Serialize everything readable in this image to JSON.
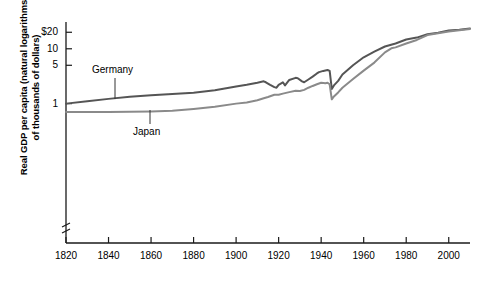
{
  "chart_data": {
    "type": "line",
    "title": "",
    "xlabel": "",
    "ylabel_line1": "Real GDP per capita (natural logarithms",
    "ylabel_line2": "of thousands of dollars)",
    "yscale": "log",
    "ytick_labels": [
      "$20",
      "10",
      "5",
      "1"
    ],
    "ytick_values": [
      20,
      10,
      5,
      1
    ],
    "xtick_labels": [
      "1820",
      "1840",
      "1860",
      "1880",
      "1900",
      "1920",
      "1940",
      "1960",
      "1980",
      "2000"
    ],
    "xtick_values": [
      1820,
      1840,
      1860,
      1880,
      1900,
      1920,
      1940,
      1960,
      1980,
      2000
    ],
    "xlim": [
      1820,
      2010
    ],
    "ylim": [
      0.55,
      26
    ],
    "grid": false,
    "legend": "inline-annotations",
    "axis_break": "y-axis break below 1",
    "series": [
      {
        "name": "Germany",
        "color": "#555555",
        "annotation": "Germany",
        "points": [
          [
            1820,
            1.0
          ],
          [
            1830,
            1.1
          ],
          [
            1840,
            1.22
          ],
          [
            1850,
            1.33
          ],
          [
            1860,
            1.42
          ],
          [
            1870,
            1.5
          ],
          [
            1880,
            1.58
          ],
          [
            1890,
            1.75
          ],
          [
            1900,
            2.05
          ],
          [
            1905,
            2.2
          ],
          [
            1910,
            2.4
          ],
          [
            1913,
            2.55
          ],
          [
            1914,
            2.45
          ],
          [
            1916,
            2.2
          ],
          [
            1918,
            2.0
          ],
          [
            1919,
            1.95
          ],
          [
            1920,
            2.2
          ],
          [
            1922,
            2.45
          ],
          [
            1923,
            2.15
          ],
          [
            1925,
            2.7
          ],
          [
            1928,
            2.95
          ],
          [
            1929,
            2.9
          ],
          [
            1931,
            2.55
          ],
          [
            1932,
            2.45
          ],
          [
            1934,
            2.75
          ],
          [
            1936,
            3.1
          ],
          [
            1938,
            3.55
          ],
          [
            1939,
            3.75
          ],
          [
            1941,
            3.95
          ],
          [
            1943,
            4.1
          ],
          [
            1944,
            3.95
          ],
          [
            1945,
            1.85
          ],
          [
            1946,
            2.15
          ],
          [
            1948,
            2.6
          ],
          [
            1950,
            3.4
          ],
          [
            1955,
            5.0
          ],
          [
            1960,
            7.0
          ],
          [
            1965,
            8.9
          ],
          [
            1970,
            11.0
          ],
          [
            1975,
            12.5
          ],
          [
            1980,
            14.8
          ],
          [
            1985,
            16.0
          ],
          [
            1990,
            18.4
          ],
          [
            1995,
            19.6
          ],
          [
            2000,
            21.5
          ],
          [
            2005,
            22.3
          ],
          [
            2010,
            23.5
          ]
        ]
      },
      {
        "name": "Japan",
        "color": "#8a8a8a",
        "annotation": "Japan",
        "points": [
          [
            1820,
            0.7
          ],
          [
            1840,
            0.7
          ],
          [
            1860,
            0.72
          ],
          [
            1870,
            0.74
          ],
          [
            1880,
            0.8
          ],
          [
            1890,
            0.88
          ],
          [
            1900,
            1.0
          ],
          [
            1905,
            1.05
          ],
          [
            1910,
            1.15
          ],
          [
            1913,
            1.25
          ],
          [
            1915,
            1.32
          ],
          [
            1918,
            1.45
          ],
          [
            1920,
            1.45
          ],
          [
            1922,
            1.52
          ],
          [
            1925,
            1.62
          ],
          [
            1928,
            1.72
          ],
          [
            1930,
            1.7
          ],
          [
            1932,
            1.78
          ],
          [
            1934,
            1.95
          ],
          [
            1936,
            2.1
          ],
          [
            1938,
            2.25
          ],
          [
            1940,
            2.4
          ],
          [
            1942,
            2.35
          ],
          [
            1943,
            2.4
          ],
          [
            1944,
            2.25
          ],
          [
            1945,
            1.2
          ],
          [
            1946,
            1.35
          ],
          [
            1948,
            1.6
          ],
          [
            1950,
            1.95
          ],
          [
            1955,
            2.8
          ],
          [
            1960,
            4.0
          ],
          [
            1965,
            5.6
          ],
          [
            1970,
            8.6
          ],
          [
            1973,
            10.2
          ],
          [
            1975,
            10.6
          ],
          [
            1980,
            12.5
          ],
          [
            1985,
            14.5
          ],
          [
            1990,
            17.8
          ],
          [
            1995,
            19.2
          ],
          [
            2000,
            20.6
          ],
          [
            2005,
            21.8
          ],
          [
            2010,
            23.0
          ]
        ]
      }
    ]
  }
}
